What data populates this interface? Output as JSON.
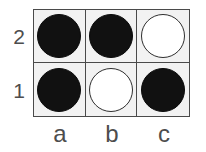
{
  "diagram": {
    "type": "grid-board",
    "title": "",
    "columns": 3,
    "rows": 2,
    "column_labels": [
      "a",
      "b",
      "c"
    ],
    "row_labels": [
      "2",
      "1"
    ],
    "colors": {
      "board_background": "#f2f2f2",
      "grid_line": "#4a4a4a",
      "black_stone": "#111111",
      "white_stone": "#ffffff",
      "white_stone_outline": "#2f2f2f",
      "label_text": "#4d4d4d",
      "page_background": "#ffffff"
    },
    "cells": [
      {
        "id": "a2",
        "column": "a",
        "row": "2",
        "stone": "black",
        "stone_label": "black-stone"
      },
      {
        "id": "b2",
        "column": "b",
        "row": "2",
        "stone": "black",
        "stone_label": "black-stone"
      },
      {
        "id": "c2",
        "column": "c",
        "row": "2",
        "stone": "white",
        "stone_label": "white-stone"
      },
      {
        "id": "a1",
        "column": "a",
        "row": "1",
        "stone": "black",
        "stone_label": "black-stone"
      },
      {
        "id": "b1",
        "column": "b",
        "row": "1",
        "stone": "white",
        "stone_label": "white-stone"
      },
      {
        "id": "c1",
        "column": "c",
        "row": "1",
        "stone": "black",
        "stone_label": "black-stone"
      }
    ]
  }
}
